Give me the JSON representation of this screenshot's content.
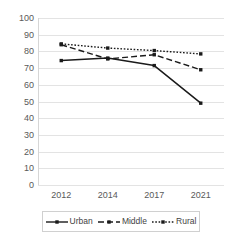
{
  "chart_data": {
    "type": "line",
    "title": "",
    "xlabel": "",
    "ylabel": "",
    "categories": [
      "2012",
      "2014",
      "2017",
      "2021"
    ],
    "ylim": [
      0,
      100
    ],
    "ytick_step": 10,
    "yticks": [
      "100",
      "90",
      "80",
      "70",
      "60",
      "50",
      "40",
      "30",
      "20",
      "10",
      "0"
    ],
    "grid": "horizontal",
    "legend_position": "bottom",
    "series": [
      {
        "name": "Urban",
        "values": [
          74.5,
          76,
          71.5,
          49
        ],
        "style": "solid",
        "marker": "square",
        "color": "#1a1a1a"
      },
      {
        "name": "Middle",
        "values": [
          84,
          75.5,
          78,
          69
        ],
        "style": "dashed",
        "marker": "square",
        "color": "#1a1a1a"
      },
      {
        "name": "Rural",
        "values": [
          84.5,
          82,
          80.5,
          78.5
        ],
        "style": "dotted",
        "marker": "square",
        "color": "#1a1a1a"
      }
    ]
  },
  "legend": {
    "items": [
      {
        "label": "Urban"
      },
      {
        "label": "Middle"
      },
      {
        "label": "Rural"
      }
    ]
  },
  "colors": {
    "gridline": "#e3e3e3",
    "axis": "#d6d6d6",
    "tick_text": "#595959",
    "series": "#1a1a1a",
    "background": "#ffffff",
    "legend_border": "#d0d0d0"
  }
}
